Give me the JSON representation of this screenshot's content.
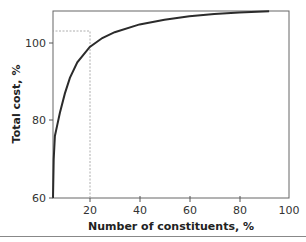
{
  "chart_data": {
    "type": "line",
    "title": "",
    "xlabel": "Number of constituents, %",
    "ylabel": "Total cost, %",
    "xlim": [
      5,
      100
    ],
    "ylim": [
      60,
      108
    ],
    "x_ticks": [
      20,
      40,
      60,
      80,
      100
    ],
    "y_ticks": [
      60,
      80,
      100
    ],
    "grid": false,
    "legend": null,
    "series": [
      {
        "name": "Total cost curve",
        "x": [
          5,
          5.5,
          6,
          7,
          8,
          10,
          12,
          15,
          20,
          25,
          30,
          40,
          50,
          60,
          70,
          80,
          92
        ],
        "y": [
          60,
          70,
          76,
          79,
          82,
          87,
          91,
          95,
          99,
          101.3,
          102.8,
          104.8,
          106,
          106.9,
          107.5,
          107.9,
          108.2
        ]
      }
    ],
    "annotations": [
      {
        "type": "dashed-guide",
        "x": 20,
        "y": 103.3,
        "description": "dashed lines from x=20 up to y≈103 and across to the y-axis"
      }
    ]
  },
  "labels": {
    "xlabel": "Number of constituents, %",
    "ylabel": "Total cost, %",
    "xticks": [
      "20",
      "40",
      "60",
      "80",
      "100"
    ],
    "yticks": [
      "60",
      "80",
      "100"
    ]
  },
  "colors": {
    "curve": "#2b2b2b",
    "axis": "#555555",
    "dashed": "#888888"
  }
}
